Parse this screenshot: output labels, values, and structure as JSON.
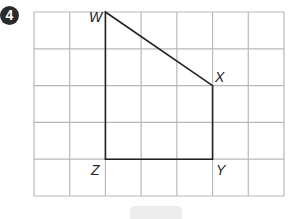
{
  "question": {
    "number": "4"
  },
  "grid": {
    "cols": 7,
    "rows": 5,
    "left": 34,
    "top": 12,
    "right": 284,
    "bottom": 196,
    "line_color": "#b8b8b8"
  },
  "shape": {
    "stroke": "#222222",
    "vertices": [
      {
        "name": "W",
        "col": 2,
        "row": 0
      },
      {
        "name": "X",
        "col": 5,
        "row": 2
      },
      {
        "name": "Y",
        "col": 5,
        "row": 4
      },
      {
        "name": "Z",
        "col": 2,
        "row": 4
      }
    ]
  },
  "labels": {
    "w": "W",
    "x": "X",
    "y": "Y",
    "z": "Z"
  }
}
